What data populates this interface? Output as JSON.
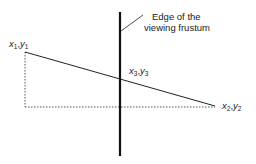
{
  "diagram": {
    "caption_line1": "Edge of the",
    "caption_line2": "viewing frustum",
    "points": {
      "p1": {
        "x": "x",
        "sub_x": "1",
        "y": "y",
        "sub_y": "1"
      },
      "p2": {
        "x": "x",
        "sub_x": "2",
        "y": "y",
        "sub_y": "2"
      },
      "p3": {
        "x": "x",
        "sub_x": "3",
        "y": "y",
        "sub_y": "3"
      }
    },
    "colors": {
      "line": "#222222",
      "dotted": "#555555",
      "text": "#222222"
    }
  }
}
